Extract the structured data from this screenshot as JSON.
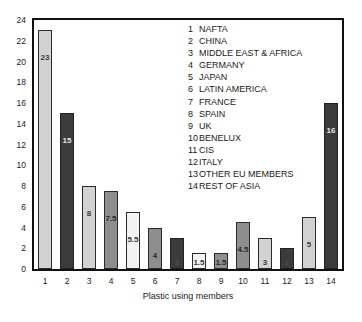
{
  "chart_data": {
    "type": "bar",
    "title": "",
    "xlabel": "Plastic using members",
    "ylabel": "% of plastic use",
    "ylim": [
      0,
      24
    ],
    "ytick_step": 2,
    "yticks": [
      "24",
      "22",
      "20",
      "18",
      "16",
      "14",
      "12",
      "10",
      "8",
      "6",
      "4",
      "2",
      "0"
    ],
    "grid": false,
    "legend_position": "inside-top-right",
    "categories": [
      "1",
      "2",
      "3",
      "4",
      "5",
      "6",
      "7",
      "8",
      "9",
      "10",
      "11",
      "12",
      "13",
      "14"
    ],
    "values": [
      23,
      15,
      8,
      7.5,
      5.5,
      4,
      3,
      1.5,
      1.5,
      4.5,
      3,
      2,
      5,
      16
    ],
    "bar_labels": [
      "23",
      "15",
      "8",
      "7.5",
      "5.5",
      "4",
      "3",
      "1.5",
      "1.5",
      "4.5",
      "3",
      "2",
      "5",
      "16"
    ],
    "bar_styles": [
      "light",
      "dark",
      "light",
      "mid",
      "pale",
      "mid",
      "dark",
      "pale",
      "mid",
      "mid",
      "light",
      "dark",
      "light",
      "dark"
    ],
    "series": [
      {
        "name": "% of plastic use",
        "values": [
          23,
          15,
          8,
          7.5,
          5.5,
          4,
          3,
          1.5,
          1.5,
          4.5,
          3,
          2,
          5,
          16
        ]
      }
    ],
    "legend": [
      {
        "num": "1",
        "label": "NAFTA"
      },
      {
        "num": "2",
        "label": "CHINA"
      },
      {
        "num": "3",
        "label": "MIDDLE EAST & AFRICA"
      },
      {
        "num": "4",
        "label": "GERMANY"
      },
      {
        "num": "5",
        "label": "JAPAN"
      },
      {
        "num": "6",
        "label": "LATIN AMERICA"
      },
      {
        "num": "7",
        "label": "FRANCE"
      },
      {
        "num": "8",
        "label": "SPAIN"
      },
      {
        "num": "9",
        "label": "UK"
      },
      {
        "num": "10",
        "label": "BENELUX"
      },
      {
        "num": "11",
        "label": "CIS"
      },
      {
        "num": "12",
        "label": "ITALY"
      },
      {
        "num": "13",
        "label": "OTHER EU MEMBERS"
      },
      {
        "num": "14",
        "label": "REST OF ASIA"
      }
    ]
  },
  "colors": {
    "light": "#d2d2d2",
    "mid": "#8e8e8e",
    "pale": "#f2f2f2",
    "dark": "#3b3b3b",
    "axis": "#111111"
  },
  "caption": ""
}
